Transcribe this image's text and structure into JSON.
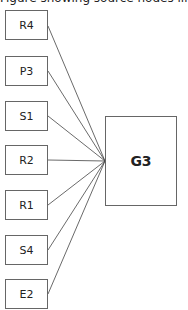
{
  "diagram": {
    "top_partial_text": "Figure showing source nodes linked to target",
    "target": {
      "label": "G3"
    },
    "sources": [
      {
        "label": "R4",
        "top": 10
      },
      {
        "label": "P3",
        "top": 56
      },
      {
        "label": "S1",
        "top": 100
      },
      {
        "label": "R2",
        "top": 145
      },
      {
        "label": "R1",
        "top": 190
      },
      {
        "label": "S4",
        "top": 235
      },
      {
        "label": "E2",
        "top": 279
      }
    ],
    "edges": [
      {
        "from": "R4",
        "to": "G3"
      },
      {
        "from": "P3",
        "to": "G3"
      },
      {
        "from": "S1",
        "to": "G3"
      },
      {
        "from": "R2",
        "to": "G3"
      },
      {
        "from": "R1",
        "to": "G3"
      },
      {
        "from": "S4",
        "to": "G3"
      },
      {
        "from": "E2",
        "to": "G3"
      }
    ]
  }
}
